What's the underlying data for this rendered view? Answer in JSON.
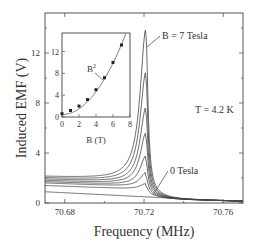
{
  "chart_data": [
    {
      "type": "line",
      "title": "",
      "xlabel": "Frequency (MHz)",
      "ylabel": "Induced EMF (V)",
      "xlim": [
        70.67,
        70.77
      ],
      "ylim": [
        0,
        15.2
      ],
      "xticks": [
        "70.68",
        "70.72",
        "70.76"
      ],
      "yticks": [
        "0",
        "4",
        "8",
        "12"
      ],
      "grid": false,
      "annotations": [
        "B = 7 Tesla",
        "0 Tesla",
        "T = 4.2 K"
      ],
      "peak_frequency": 70.721,
      "series": [
        {
          "name": "0 Tesla",
          "peak": 0.9,
          "baseline": 0.8
        },
        {
          "name": "1 Tesla",
          "peak": 1.3,
          "baseline": 1.4
        },
        {
          "name": "2 Tesla",
          "peak": 2.1,
          "baseline": 1.6
        },
        {
          "name": "3 Tesla",
          "peak": 3.4,
          "baseline": 1.7
        },
        {
          "name": "4 Tesla",
          "peak": 5.2,
          "baseline": 1.8
        },
        {
          "name": "5 Tesla",
          "peak": 7.2,
          "baseline": 1.9
        },
        {
          "name": "6 Tesla",
          "peak": 10.0,
          "baseline": 2.0
        },
        {
          "name": "7 Tesla",
          "peak": 13.4,
          "baseline": 2.1
        }
      ]
    },
    {
      "type": "scatter",
      "title": "inset",
      "xlabel": "B (T)",
      "ylabel": "",
      "xlim": [
        0,
        8
      ],
      "ylim": [
        0,
        15.4
      ],
      "xticks": [
        "0",
        "2",
        "4",
        "6",
        "8"
      ],
      "yticks": [
        "0",
        "4",
        "8",
        "12"
      ],
      "annotation": "B²",
      "x": [
        0,
        1,
        2,
        3,
        4,
        5,
        6,
        7
      ],
      "values": [
        0.6,
        1.2,
        2.0,
        3.2,
        5.0,
        7.2,
        10.0,
        13.2
      ],
      "fit": "B^2"
    }
  ]
}
